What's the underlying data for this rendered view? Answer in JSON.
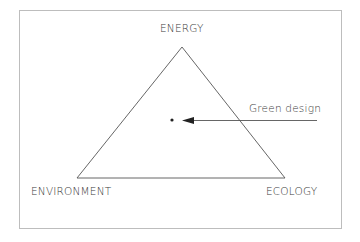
{
  "diagram": {
    "type": "triangle-concept",
    "vertices": {
      "top": "ENERGY",
      "bottom_left": "ENVIRONMENT",
      "bottom_right": "ECOLOGY"
    },
    "annotation": {
      "label": "Green design",
      "points_to": "center-point"
    },
    "colors": {
      "line": "#555555",
      "frame": "#bbbbbb",
      "text": "#3a3a3a"
    }
  }
}
